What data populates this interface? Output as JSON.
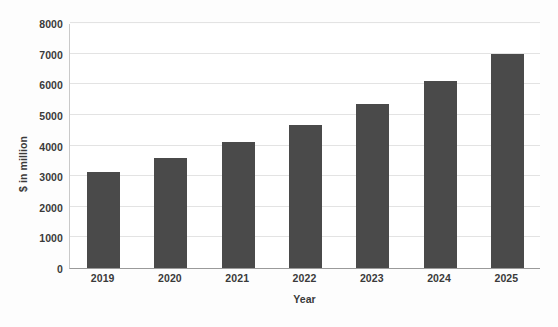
{
  "chart_data": {
    "type": "bar",
    "title": "",
    "subtitle": "",
    "xlabel": "Year",
    "ylabel": "$ in million",
    "categories": [
      "2019",
      "2020",
      "2021",
      "2022",
      "2023",
      "2024",
      "2025"
    ],
    "values": [
      3150,
      3600,
      4100,
      4670,
      5350,
      6100,
      6980
    ],
    "series": [
      {
        "name": "",
        "values": [
          3150,
          3600,
          4100,
          4670,
          5350,
          6100,
          6980
        ],
        "color": "#4a4a4a"
      }
    ],
    "ylim": [
      0,
      8000
    ],
    "ytick_step": 1000,
    "yticks": [
      0,
      1000,
      2000,
      3000,
      4000,
      5000,
      6000,
      7000,
      8000
    ],
    "ytick_labels": [
      "0",
      "1000",
      "2000",
      "3000",
      "4000",
      "5000",
      "6000",
      "7000",
      "8000"
    ],
    "grid": true,
    "grid_axis": "y",
    "grid_color": "#e3e3e3",
    "legend": false,
    "legend_position": "none",
    "bar_color": "#4a4a4a",
    "background_color": "#ffffff",
    "axis_color": "#9a9a9a",
    "text_color": "#3a3a3a",
    "annotations": [],
    "data_labels": false
  }
}
